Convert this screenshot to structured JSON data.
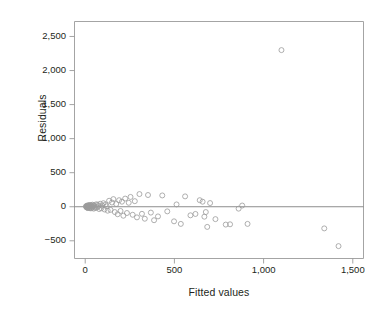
{
  "chart_data": {
    "type": "scatter",
    "title": "",
    "xlabel": "Fitted values",
    "ylabel": "Residuals",
    "xlim": [
      -60,
      1560
    ],
    "ylim": [
      -760,
      2720
    ],
    "xticks": [
      0,
      500,
      1000,
      1500
    ],
    "xtick_labels": [
      "0",
      "500",
      "1,000",
      "1,500"
    ],
    "yticks": [
      -500,
      0,
      500,
      1000,
      1500,
      2000,
      2500
    ],
    "ytick_labels": [
      "−500",
      "0",
      "500",
      "1,000",
      "1,500",
      "2,000",
      "2,500"
    ],
    "grid": false,
    "legend": null,
    "reference_line": {
      "orientation": "horizontal",
      "y": 0,
      "color": "#808080"
    },
    "marker": {
      "shape": "circle",
      "filled": false,
      "edge_color": "#9a9a9a",
      "size": 5
    },
    "frame_color": "#9a9a9a",
    "series": [
      {
        "name": "residuals",
        "points": [
          [
            4,
            6
          ],
          [
            6,
            -4
          ],
          [
            8,
            12
          ],
          [
            9,
            -10
          ],
          [
            10,
            2
          ],
          [
            11,
            -14
          ],
          [
            12,
            18
          ],
          [
            13,
            -6
          ],
          [
            14,
            8
          ],
          [
            15,
            -18
          ],
          [
            16,
            0
          ],
          [
            17,
            14
          ],
          [
            18,
            -8
          ],
          [
            19,
            22
          ],
          [
            20,
            -2
          ],
          [
            22,
            16
          ],
          [
            24,
            -20
          ],
          [
            25,
            6
          ],
          [
            27,
            26
          ],
          [
            28,
            -12
          ],
          [
            30,
            10
          ],
          [
            32,
            -24
          ],
          [
            34,
            20
          ],
          [
            36,
            4
          ],
          [
            38,
            -16
          ],
          [
            40,
            30
          ],
          [
            42,
            -6
          ],
          [
            45,
            14
          ],
          [
            48,
            -28
          ],
          [
            50,
            24
          ],
          [
            54,
            2
          ],
          [
            58,
            -18
          ],
          [
            62,
            36
          ],
          [
            66,
            -10
          ],
          [
            70,
            28
          ],
          [
            74,
            8
          ],
          [
            78,
            -34
          ],
          [
            84,
            44
          ],
          [
            90,
            -22
          ],
          [
            96,
            18
          ],
          [
            102,
            52
          ],
          [
            108,
            -40
          ],
          [
            114,
            34
          ],
          [
            120,
            6
          ],
          [
            126,
            -58
          ],
          [
            134,
            88
          ],
          [
            142,
            -46
          ],
          [
            150,
            62
          ],
          [
            158,
            112
          ],
          [
            166,
            -78
          ],
          [
            174,
            40
          ],
          [
            182,
            -110
          ],
          [
            190,
            96
          ],
          [
            198,
            -62
          ],
          [
            206,
            74
          ],
          [
            214,
            -132
          ],
          [
            224,
            120
          ],
          [
            234,
            -92
          ],
          [
            244,
            58
          ],
          [
            254,
            144
          ],
          [
            266,
            -118
          ],
          [
            278,
            82
          ],
          [
            290,
            -156
          ],
          [
            304,
            186
          ],
          [
            318,
            -104
          ],
          [
            334,
            -176
          ],
          [
            352,
            172
          ],
          [
            368,
            -86
          ],
          [
            386,
            -198
          ],
          [
            408,
            -142
          ],
          [
            432,
            166
          ],
          [
            460,
            -68
          ],
          [
            498,
            -214
          ],
          [
            512,
            34
          ],
          [
            536,
            -252
          ],
          [
            560,
            152
          ],
          [
            590,
            -126
          ],
          [
            618,
            -106
          ],
          [
            642,
            96
          ],
          [
            658,
            74
          ],
          [
            668,
            -146
          ],
          [
            676,
            -78
          ],
          [
            684,
            -296
          ],
          [
            700,
            54
          ],
          [
            730,
            -182
          ],
          [
            788,
            -262
          ],
          [
            812,
            -258
          ],
          [
            860,
            -28
          ],
          [
            880,
            18
          ],
          [
            910,
            -252
          ],
          [
            1100,
            2300
          ],
          [
            1340,
            -318
          ],
          [
            1420,
            -578
          ]
        ]
      }
    ]
  },
  "axes": {
    "y_title": "Residuals",
    "x_title": "Fitted values"
  }
}
